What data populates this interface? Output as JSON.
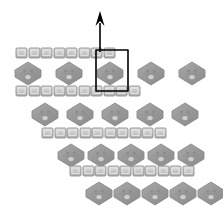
{
  "figure": {
    "title": "",
    "background_color": "#ffffff",
    "width": 223,
    "height": 212
  },
  "palette": {
    "shape_fill": "#9a9a9a",
    "shape_fill_light": "#b4b4b4",
    "shape_stroke": "#8c8c8c",
    "square_fill": "#c0c0c0",
    "square_fill_light": "#d8d8d8",
    "square_stroke": "#8f8f8f",
    "inner_detail": "#8a8a8a",
    "outline_color": "#000000",
    "arrow_color": "#000000"
  },
  "geometry": {
    "square_width": 11,
    "square_height": 10,
    "square_gap": 2,
    "pair_gap": 7,
    "hexagon_width": 26,
    "hexagon_height": 23
  },
  "arrow": {
    "name": "growth-direction-arrow",
    "label": "",
    "x_start": 100,
    "y_start": 52,
    "x_end": 100,
    "y_end": 11,
    "head_width": 9,
    "head_length": 15,
    "direction": "up"
  },
  "unit_cell": {
    "name": "unit-cell-outline",
    "label": "",
    "x": 96,
    "y": 50,
    "width": 32,
    "height": 41,
    "stroke_width": 1.6
  },
  "rows": [
    {
      "id": "row-1",
      "kind": "square-pairs",
      "y": 48,
      "x_start": 16,
      "count": 4,
      "pitch": 25
    },
    {
      "id": "row-2",
      "kind": "hexagons",
      "y": 62,
      "x_start": 15,
      "count": 5,
      "pitch": 41
    },
    {
      "id": "row-3",
      "kind": "square-pairs",
      "y": 86,
      "x_start": 16,
      "count": 5,
      "pitch": 25
    },
    {
      "id": "row-4",
      "kind": "hexagons",
      "y": 103,
      "x_start": 32,
      "count": 5,
      "pitch": 35
    },
    {
      "id": "row-5",
      "kind": "square-pairs",
      "y": 128,
      "x_start": 42,
      "count": 5,
      "pitch": 25
    },
    {
      "id": "row-6",
      "kind": "hexagons",
      "y": 144,
      "x_start": 58,
      "count": 5,
      "pitch": 30
    },
    {
      "id": "row-7",
      "kind": "square-pairs",
      "y": 166,
      "x_start": 70,
      "count": 5,
      "pitch": 25
    },
    {
      "id": "row-8",
      "kind": "hexagons",
      "y": 182,
      "x_start": 86,
      "count": 5,
      "pitch": 28
    }
  ]
}
